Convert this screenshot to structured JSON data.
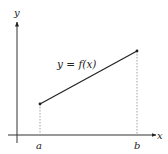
{
  "diagram": {
    "type": "function-graph",
    "axes": {
      "x_label": "x",
      "y_label": "y"
    },
    "curve": {
      "label": "y = f(x)",
      "shape": "line segment",
      "start": "(a, f(a))",
      "end": "(b, f(b))"
    },
    "x_ticks": [
      "a",
      "b"
    ],
    "guides": "dotted vertical lines from endpoints to x-axis",
    "colors": {
      "stroke": "#222222",
      "guide": "#888888"
    }
  }
}
